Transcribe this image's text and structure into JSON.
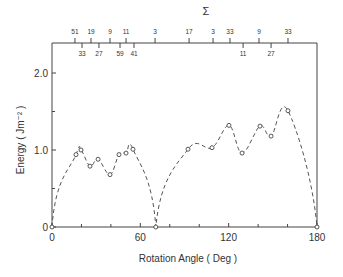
{
  "chart_data": {
    "type": "line",
    "title": "",
    "xlabel": "Rotation Angle ( Deg )",
    "ylabel": "Energy ( Jm⁻² )",
    "top_axis_label": "Σ",
    "xlim": [
      0,
      180
    ],
    "ylim": [
      0,
      2.4
    ],
    "x_ticks": [
      0,
      60,
      120,
      180
    ],
    "x_minor_ticks": [
      20,
      40,
      80,
      100,
      140,
      160
    ],
    "y_ticks": [
      0,
      1.0,
      2.0
    ],
    "y_tick_labels": [
      "0",
      "1.0",
      "2.0"
    ],
    "y_minor_ticks": [
      0.5,
      1.5
    ],
    "grid": false,
    "line_style": "dashed",
    "marker": "open-circle",
    "series": [
      {
        "name": "Grain boundary energy",
        "points": [
          {
            "x": 0,
            "y": 0
          },
          {
            "x": 16.3,
            "y": 0.94
          },
          {
            "x": 19.7,
            "y": 1.0
          },
          {
            "x": 25.8,
            "y": 0.79
          },
          {
            "x": 31.3,
            "y": 0.88
          },
          {
            "x": 39.4,
            "y": 0.68
          },
          {
            "x": 45.5,
            "y": 0.94
          },
          {
            "x": 50.3,
            "y": 0.96
          },
          {
            "x": 55.0,
            "y": 1.01
          },
          {
            "x": 70.5,
            "y": 0
          },
          {
            "x": 92.4,
            "y": 1.01
          },
          {
            "x": 108.7,
            "y": 1.03
          },
          {
            "x": 120.2,
            "y": 1.32
          },
          {
            "x": 129.1,
            "y": 0.96
          },
          {
            "x": 141.3,
            "y": 1.31
          },
          {
            "x": 148.8,
            "y": 1.18
          },
          {
            "x": 160.3,
            "y": 1.51
          },
          {
            "x": 180,
            "y": 0
          }
        ]
      }
    ],
    "sigma_ticks_upper": [
      {
        "x": 15.6,
        "label": "51"
      },
      {
        "x": 26.5,
        "label": "19"
      },
      {
        "x": 39.4,
        "label": "9"
      },
      {
        "x": 50.3,
        "label": "11"
      },
      {
        "x": 70.0,
        "label": "3"
      },
      {
        "x": 93.1,
        "label": "17"
      },
      {
        "x": 109.4,
        "label": "3"
      },
      {
        "x": 120.9,
        "label": "33"
      },
      {
        "x": 140.6,
        "label": "9"
      },
      {
        "x": 160.3,
        "label": "33"
      }
    ],
    "sigma_ticks_lower": [
      {
        "x": 20.4,
        "label": "33"
      },
      {
        "x": 31.9,
        "label": "27"
      },
      {
        "x": 46.2,
        "label": "59"
      },
      {
        "x": 55.7,
        "label": "41"
      },
      {
        "x": 129.8,
        "label": "11"
      },
      {
        "x": 148.8,
        "label": "27"
      }
    ]
  },
  "colors": {
    "axis": "#444444",
    "line": "#555555",
    "text": "#333333"
  }
}
